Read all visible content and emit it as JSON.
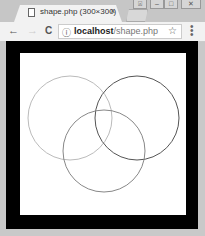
{
  "window": {
    "controls": [
      {
        "name": "user-button",
        "glyph": "⍓"
      },
      {
        "name": "minimize-button",
        "glyph": "–"
      },
      {
        "name": "maximize-button",
        "glyph": "□"
      },
      {
        "name": "close-button",
        "glyph": "✕"
      }
    ]
  },
  "tab": {
    "title": "shape.php (300×300)",
    "close_glyph": "×",
    "icon": "page-icon"
  },
  "toolbar": {
    "back_glyph": "←",
    "forward_glyph": "→",
    "reload_glyph": "C",
    "info_glyph": "ⓘ",
    "url_host": "localhost",
    "url_path": "/shape.php",
    "star_glyph": "☆",
    "menu_glyph": "⋮"
  },
  "canvas": {
    "background": "#ffffff",
    "frame_color": "#000000",
    "circles": [
      {
        "cx": 50,
        "cy": 65,
        "r": 42,
        "stroke": "#bbbbbb"
      },
      {
        "cx": 117,
        "cy": 65,
        "r": 42,
        "stroke": "#555555"
      },
      {
        "cx": 84,
        "cy": 98,
        "r": 41,
        "stroke": "#888888"
      }
    ]
  }
}
